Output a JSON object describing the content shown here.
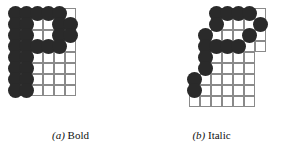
{
  "figure": {
    "background_color": "#ffffff",
    "ink_color": "#2a2a2a",
    "grid_line_color": "#8a8a8a",
    "cell_size_px": 11,
    "dot_diameter_px": 15,
    "panels": [
      {
        "id": "bold",
        "caption_marker": "(a)",
        "caption_text": "Bold",
        "grid": {
          "columns": 6,
          "rows": 8
        },
        "description": "Bitmap of letter P rendered in a bold weight on a 6 by 8 pixel grid",
        "on_cells": [
          [
            0,
            0
          ],
          [
            1,
            0
          ],
          [
            2,
            0
          ],
          [
            3,
            0
          ],
          [
            4,
            0
          ],
          [
            0,
            1
          ],
          [
            1,
            1
          ],
          [
            4,
            1
          ],
          [
            5,
            1
          ],
          [
            0,
            2
          ],
          [
            1,
            2
          ],
          [
            4,
            2
          ],
          [
            5,
            2
          ],
          [
            0,
            3
          ],
          [
            1,
            3
          ],
          [
            2,
            3
          ],
          [
            3,
            3
          ],
          [
            4,
            3
          ],
          [
            0,
            4
          ],
          [
            1,
            4
          ],
          [
            0,
            5
          ],
          [
            1,
            5
          ],
          [
            0,
            6
          ],
          [
            1,
            6
          ],
          [
            0,
            7
          ],
          [
            1,
            7
          ]
        ]
      },
      {
        "id": "italic",
        "caption_marker": "(b)",
        "caption_text": "Italic",
        "grid": {
          "columns": 8,
          "rows": 9,
          "shape": "staircase"
        },
        "description": "Bitmap of letter P rendered in an italic slanted style on a stair-stepped pixel grid",
        "grid_rows_extent": [
          {
            "row": 0,
            "start_col": 3,
            "end_col": 7
          },
          {
            "row": 1,
            "start_col": 3,
            "end_col": 7
          },
          {
            "row": 2,
            "start_col": 2,
            "end_col": 7
          },
          {
            "row": 3,
            "start_col": 2,
            "end_col": 7
          },
          {
            "row": 4,
            "start_col": 2,
            "end_col": 6
          },
          {
            "row": 5,
            "start_col": 2,
            "end_col": 6
          },
          {
            "row": 6,
            "start_col": 1,
            "end_col": 6
          },
          {
            "row": 7,
            "start_col": 1,
            "end_col": 6
          },
          {
            "row": 8,
            "start_col": 1,
            "end_col": 6
          }
        ],
        "on_cells": [
          [
            3,
            0
          ],
          [
            4,
            0
          ],
          [
            5,
            0
          ],
          [
            6,
            0
          ],
          [
            3,
            1
          ],
          [
            7,
            1
          ],
          [
            2,
            2
          ],
          [
            6,
            2
          ],
          [
            2,
            3
          ],
          [
            3,
            3
          ],
          [
            4,
            3
          ],
          [
            5,
            3
          ],
          [
            2,
            4
          ],
          [
            2,
            5
          ],
          [
            1,
            6
          ],
          [
            1,
            7
          ]
        ]
      }
    ]
  }
}
